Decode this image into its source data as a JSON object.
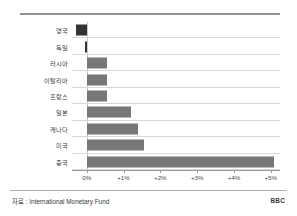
{
  "chart_data": {
    "type": "bar",
    "orientation": "horizontal",
    "title": "",
    "xlabel": "",
    "ylabel": "",
    "categories": [
      "영국",
      "독일",
      "러시아",
      "이탈리아",
      "프랑스",
      "일본",
      "캐나다",
      "미국",
      "중국"
    ],
    "values": [
      -0.3,
      -0.05,
      0.55,
      0.55,
      0.55,
      1.2,
      1.4,
      1.55,
      5.1
    ],
    "unit": "%",
    "xlim": [
      -0.4,
      5.25
    ],
    "xticks": [
      0,
      1,
      2,
      3,
      4,
      5
    ],
    "xtick_labels": [
      "0%",
      "+1%",
      "+2%",
      "+3%",
      "+4%",
      "+5%"
    ],
    "grid": true,
    "grid_axis": "y",
    "legend": false,
    "bar_color": "#777777",
    "negative_bar_color": "#333333"
  },
  "footer": {
    "source": "자료 : International Monetary Fund",
    "brand": "BBC"
  }
}
